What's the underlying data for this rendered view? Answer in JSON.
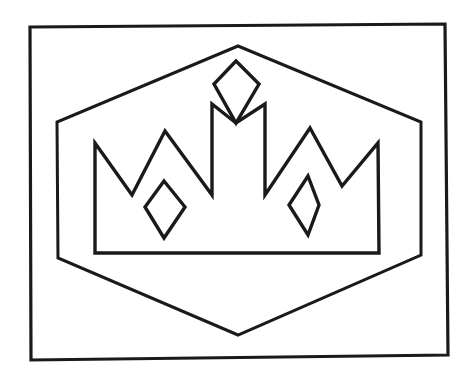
{
  "document": {
    "kind": "line-art-coloring-page",
    "title": "Crown Inside Hexagon Outline Drawing",
    "background_color": "#ffffff",
    "ink_color": "#1a1a1a",
    "canvas": {
      "width": 469,
      "height": 380
    }
  },
  "artwork": {
    "description": "Black outline drawing of a five-point crown with three diamond gems, enclosed in a hexagon, framed by a slightly tilted rectangular border.",
    "shapes": [
      {
        "name": "outer-frame",
        "label": "Outer rectangular border",
        "stroke_color": "#1a1a1a",
        "stroke_width": 3.2,
        "points": "30,27 445,24 448,355 31,360"
      },
      {
        "name": "hexagon-frame",
        "label": "Hexagon enclosing the crown",
        "stroke_color": "#1a1a1a",
        "stroke_width": 3.0,
        "points": "238,46 421,122 421,255 238,335 58,258 57,122"
      },
      {
        "name": "crown-body",
        "label": "Crown silhouette with five points",
        "stroke_color": "#1a1a1a",
        "stroke_width": 3.4,
        "points": "95,143 132,195 165,131 212,195 212,104 236,123 265,104 265,195 310,128 342,186 378,143 379,253 95,253"
      },
      {
        "name": "top-gem-diamond",
        "label": "Top centre diamond gem",
        "stroke_color": "#1a1a1a",
        "stroke_width": 3.4,
        "points": "236,61 259,84 236,123 214,84"
      },
      {
        "name": "left-gem-diamond",
        "label": "Left diamond gem",
        "stroke_color": "#1a1a1a",
        "stroke_width": 3.4,
        "points": "164,181 185,207 164,238 145,207"
      },
      {
        "name": "right-gem-diamond",
        "label": "Right diamond gem",
        "stroke_color": "#1a1a1a",
        "stroke_width": 3.4,
        "points": "308,176 319,205 308,235 289,205"
      }
    ]
  }
}
